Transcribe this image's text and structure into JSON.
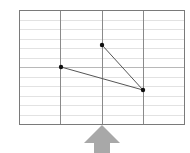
{
  "diagram": {
    "grid": {
      "left": 19,
      "top": 10,
      "right": 184,
      "bottom": 124,
      "columns": 4,
      "rows": 12,
      "frame_color": "#7a7a7a",
      "major_line_color": "#8a8a8a",
      "minor_line_color": "#e2e2e2",
      "middle_row_line_color": "#b8b8b8"
    },
    "points": [
      {
        "id": "p1",
        "x": 61,
        "y": 67
      },
      {
        "id": "p2",
        "x": 102,
        "y": 45
      },
      {
        "id": "p3",
        "x": 143,
        "y": 90
      }
    ],
    "segments": [
      {
        "from": "p1",
        "to": "p3"
      },
      {
        "from": "p2",
        "to": "p3"
      }
    ],
    "point_color": "#111111",
    "segment_color": "#555555",
    "arrow": {
      "direction": "up",
      "color": "#a8a8a8",
      "tip_x": 102,
      "tip_y": 125
    }
  }
}
